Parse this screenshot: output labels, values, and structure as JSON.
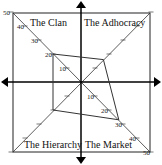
{
  "quadrants": [
    {
      "id": "clan",
      "label": "The Clan",
      "position": "top-left",
      "score": 20
    },
    {
      "id": "adhocracy",
      "label": "The Adhocracy",
      "position": "top-right",
      "score": 16
    },
    {
      "id": "market",
      "label": "The Market",
      "position": "bottom-right",
      "score": 27
    },
    {
      "id": "hierarchy",
      "label": "The Hierarchy",
      "position": "bottom-left",
      "score": 20
    }
  ],
  "tick_values": [
    10,
    20,
    30,
    40,
    50
  ],
  "labeled_ticks": {
    "clan": [
      "10",
      "20",
      "30",
      "40",
      "50"
    ],
    "market": [
      "10",
      "20",
      "30",
      "40",
      "50"
    ]
  },
  "colors": {
    "line": "#222222",
    "polygon": "#333333",
    "background": "#ffffff"
  }
}
